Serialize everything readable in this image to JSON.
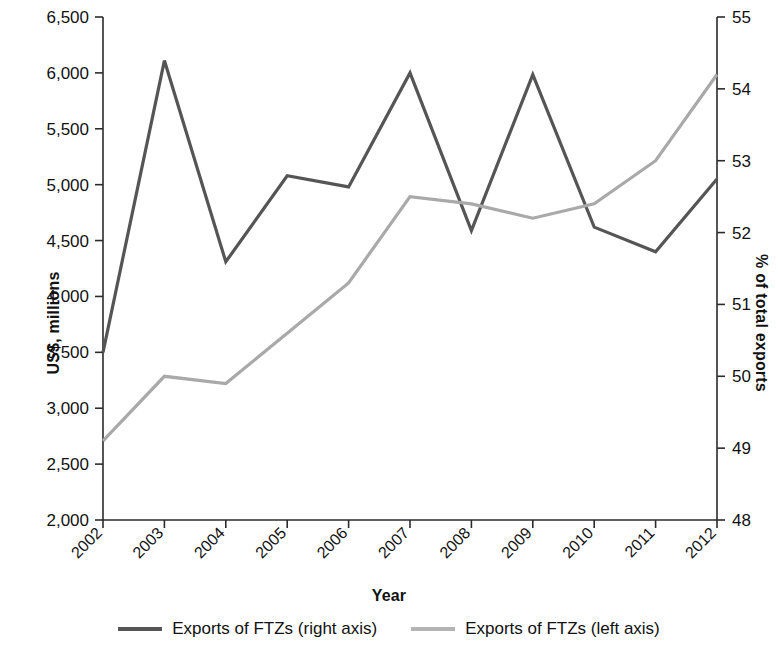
{
  "chart_data": {
    "type": "line",
    "title": "",
    "xlabel": "Year",
    "ylabel": "US$, millions",
    "ylabel_right": "% of total exports",
    "categories": [
      "2002",
      "2003",
      "2004",
      "2005",
      "2006",
      "2007",
      "2008",
      "2009",
      "2010",
      "2011",
      "2012"
    ],
    "ylim": [
      2000,
      6500
    ],
    "ylim_right": [
      48,
      55
    ],
    "ytick_labels": [
      "2,000",
      "2,500",
      "3,000",
      "3,500",
      "4,000",
      "4,500",
      "5,000",
      "5,500",
      "6,000",
      "6,500"
    ],
    "ytick_values": [
      2000,
      2500,
      3000,
      3500,
      4000,
      4500,
      5000,
      5500,
      6000,
      6500
    ],
    "ytick_right_labels": [
      "48",
      "49",
      "50",
      "51",
      "52",
      "53",
      "54",
      "55"
    ],
    "ytick_right_values": [
      48,
      49,
      50,
      51,
      52,
      53,
      54,
      55
    ],
    "grid": false,
    "legend_position": "bottom",
    "series": [
      {
        "name": "Exports of FTZs (right axis)",
        "axis": "left",
        "color": "#555555",
        "values": [
          3500,
          6110,
          4310,
          5080,
          4980,
          6000,
          4590,
          5985,
          4620,
          4400,
          5050
        ]
      },
      {
        "name": "Exports of FTZs (left axis)",
        "axis": "right",
        "color": "#a9a9a9",
        "values": [
          49.1,
          50.0,
          49.9,
          50.6,
          51.3,
          52.5,
          52.4,
          52.2,
          52.4,
          53.0,
          54.2
        ]
      }
    ]
  },
  "legend": {
    "items": [
      {
        "label": "Exports of FTZs (right axis)",
        "swatch": "dark"
      },
      {
        "label": "Exports of FTZs (left axis)",
        "swatch": "light"
      }
    ]
  }
}
